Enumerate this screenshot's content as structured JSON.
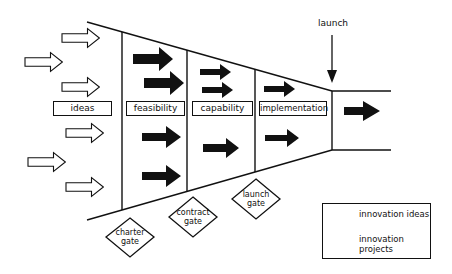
{
  "diagram": {
    "type": "innovation funnel / stage-gate",
    "launch_label": "launch",
    "stages": [
      {
        "id": "ideas",
        "label": "ideas"
      },
      {
        "id": "feasibility",
        "label": "feasibility"
      },
      {
        "id": "capability",
        "label": "capability"
      },
      {
        "id": "implementation",
        "label": "implementation"
      }
    ],
    "gates": [
      {
        "id": "charter",
        "line1": "charter",
        "line2": "gate"
      },
      {
        "id": "contract",
        "line1": "contract",
        "line2": "gate"
      },
      {
        "id": "launch",
        "line1": "launch",
        "line2": "gate"
      }
    ],
    "legend": {
      "ideas_label": "innovation ideas",
      "projects_line1": "innovation",
      "projects_line2": "projects"
    },
    "colors": {
      "line": "#111111",
      "fill_dark": "#111111",
      "background": "#ffffff"
    }
  }
}
